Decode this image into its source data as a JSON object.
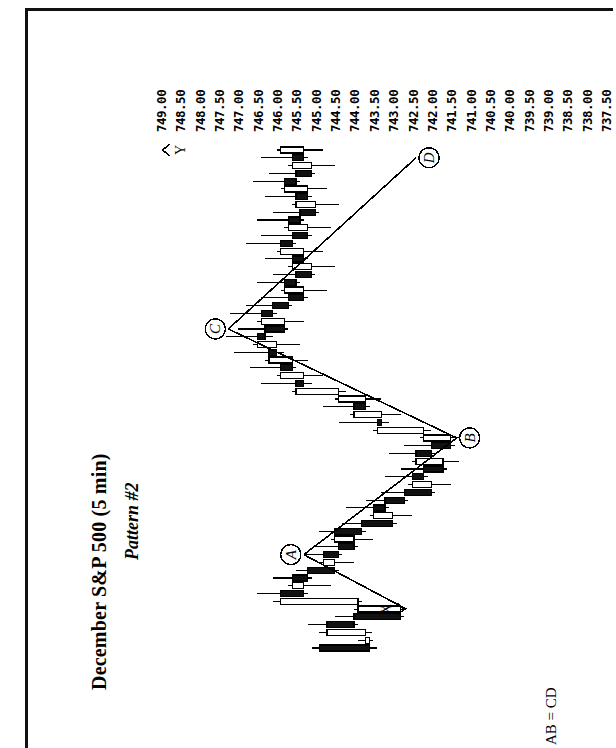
{
  "page": {
    "orientation": "rotated-90-ccw",
    "background": "#ffffff",
    "ink": "#000000"
  },
  "header": {
    "title": "December S&P 500 (5 min)",
    "subtitle": "Pattern #2"
  },
  "footer": {
    "note": "AB = CD"
  },
  "axis": {
    "name": "price-axis",
    "unit": "index points",
    "tick_step": 0.5,
    "labels": [
      "749.00",
      "748.50",
      "748.00",
      "747.50",
      "747.00",
      "746.50",
      "746.00",
      "745.50",
      "745.00",
      "744.50",
      "744.00",
      "743.50",
      "743.00",
      "742.50",
      "742.00",
      "741.50",
      "741.00",
      "740.50",
      "740.00",
      "739.50",
      "739.00",
      "738.50",
      "738.00",
      "737.50"
    ]
  },
  "annotations": {
    "points": [
      {
        "id": "A",
        "label": "A"
      },
      {
        "id": "B",
        "label": "B"
      },
      {
        "id": "C",
        "label": "C"
      },
      {
        "id": "D",
        "label": "D"
      }
    ],
    "markers": [
      {
        "id": "X",
        "label": "X"
      },
      {
        "id": "Y",
        "label": "Y"
      }
    ]
  },
  "chart_data": {
    "type": "bar",
    "subtype": "candlestick-horizontal",
    "title": "December S&P 500 (5 min)",
    "subtitle": "Pattern #2",
    "xlabel": "Time (5 minute bars)",
    "ylabel": "Price",
    "ylim": [
      737.5,
      749.0
    ],
    "grid": false,
    "legend": null,
    "categories": [
      "1",
      "2",
      "3",
      "4",
      "5",
      "6",
      "7",
      "8",
      "9",
      "10",
      "11",
      "12",
      "13",
      "14",
      "15",
      "16",
      "17",
      "18",
      "19",
      "20",
      "21",
      "22",
      "23",
      "24",
      "25",
      "26",
      "27",
      "28",
      "29",
      "30",
      "31",
      "32",
      "33",
      "34",
      "35",
      "36",
      "37",
      "38",
      "39",
      "40",
      "41",
      "42",
      "43",
      "44",
      "45",
      "46",
      "47",
      "48",
      "49",
      "50",
      "51",
      "52",
      "53",
      "54",
      "55",
      "56",
      "57",
      "58",
      "59",
      "60",
      "61",
      "62",
      "63",
      "64",
      "65"
    ],
    "series": [
      {
        "name": "OHLC",
        "fields": [
          "open",
          "high",
          "low",
          "close"
        ],
        "values": [
          [
            744.6,
            744.8,
            743.1,
            743.3
          ],
          [
            743.3,
            743.6,
            743.2,
            743.4
          ],
          [
            743.4,
            744.6,
            743.25,
            744.4
          ],
          [
            744.4,
            744.9,
            743.6,
            743.7
          ],
          [
            743.7,
            744.2,
            742.4,
            742.5
          ],
          [
            742.5,
            743.7,
            742.35,
            743.6
          ],
          [
            743.6,
            745.8,
            743.5,
            745.6
          ],
          [
            745.6,
            746.2,
            744.9,
            745.0
          ],
          [
            745.0,
            745.4,
            744.3,
            745.3
          ],
          [
            745.3,
            745.8,
            744.8,
            744.9
          ],
          [
            744.9,
            745.2,
            744.1,
            744.2
          ],
          [
            744.2,
            744.6,
            743.7,
            744.5
          ],
          [
            744.5,
            745.0,
            744.0,
            744.1
          ],
          [
            744.1,
            744.7,
            743.6,
            743.7
          ],
          [
            743.7,
            744.3,
            743.2,
            744.2
          ],
          [
            744.2,
            744.6,
            743.4,
            743.5
          ],
          [
            743.5,
            744.0,
            742.6,
            742.7
          ],
          [
            742.7,
            743.3,
            742.2,
            743.2
          ],
          [
            743.2,
            743.9,
            742.8,
            742.9
          ],
          [
            742.9,
            743.4,
            742.3,
            742.4
          ],
          [
            742.4,
            743.0,
            741.6,
            741.7
          ],
          [
            741.7,
            742.3,
            741.2,
            742.2
          ],
          [
            742.2,
            742.9,
            741.8,
            741.9
          ],
          [
            741.9,
            742.5,
            741.3,
            741.4
          ],
          [
            741.4,
            742.2,
            741.0,
            742.1
          ],
          [
            742.1,
            742.8,
            741.6,
            741.7
          ],
          [
            741.7,
            742.4,
            741.1,
            741.2
          ],
          [
            741.2,
            742.0,
            740.8,
            741.9
          ],
          [
            741.9,
            743.2,
            741.7,
            743.1
          ],
          [
            743.1,
            744.1,
            742.8,
            743.0
          ],
          [
            743.0,
            743.8,
            742.5,
            743.7
          ],
          [
            743.7,
            744.5,
            743.3,
            743.4
          ],
          [
            743.4,
            744.2,
            743.0,
            744.1
          ],
          [
            744.1,
            745.3,
            743.9,
            745.2
          ],
          [
            745.2,
            746.1,
            744.8,
            745.0
          ],
          [
            745.0,
            745.7,
            744.5,
            745.6
          ],
          [
            745.6,
            746.4,
            745.2,
            745.3
          ],
          [
            745.3,
            746.0,
            744.9,
            745.9
          ],
          [
            745.9,
            746.8,
            745.5,
            745.7
          ],
          [
            745.7,
            746.3,
            745.1,
            746.2
          ],
          [
            746.2,
            747.0,
            745.8,
            746.0
          ],
          [
            746.0,
            746.7,
            745.4,
            745.5
          ],
          [
            745.5,
            746.2,
            745.0,
            746.1
          ],
          [
            746.1,
            746.9,
            745.7,
            745.8
          ],
          [
            745.8,
            746.5,
            745.3,
            745.4
          ],
          [
            745.4,
            746.1,
            744.9,
            745.0
          ],
          [
            745.0,
            745.6,
            744.4,
            745.5
          ],
          [
            745.5,
            746.2,
            745.1,
            745.2
          ],
          [
            745.2,
            745.8,
            744.7,
            744.8
          ],
          [
            744.8,
            745.4,
            744.2,
            745.3
          ],
          [
            745.3,
            746.0,
            744.9,
            745.0
          ],
          [
            745.0,
            745.7,
            744.5,
            745.6
          ],
          [
            745.6,
            746.5,
            745.2,
            745.3
          ],
          [
            745.3,
            746.1,
            744.8,
            744.9
          ],
          [
            744.9,
            745.5,
            744.3,
            745.4
          ],
          [
            745.4,
            746.2,
            745.0,
            745.1
          ],
          [
            745.1,
            745.8,
            744.6,
            744.7
          ],
          [
            744.7,
            745.3,
            744.1,
            745.2
          ],
          [
            745.2,
            746.0,
            744.8,
            744.9
          ],
          [
            744.9,
            745.6,
            744.4,
            745.5
          ],
          [
            745.5,
            746.3,
            745.1,
            745.2
          ],
          [
            745.2,
            745.9,
            744.7,
            744.8
          ],
          [
            744.8,
            745.4,
            744.2,
            745.3
          ],
          [
            745.3,
            746.1,
            744.9,
            745.0
          ],
          [
            745.0,
            745.7,
            744.5,
            745.6
          ]
        ]
      }
    ],
    "annotations": [
      {
        "label": "X",
        "note": "pattern origin low"
      },
      {
        "label": "A",
        "note": "swing high"
      },
      {
        "label": "B",
        "note": "swing low"
      },
      {
        "label": "C",
        "note": "swing high"
      },
      {
        "label": "D",
        "note": "completion point"
      },
      {
        "label": "Y",
        "note": "post-pattern high"
      }
    ]
  }
}
